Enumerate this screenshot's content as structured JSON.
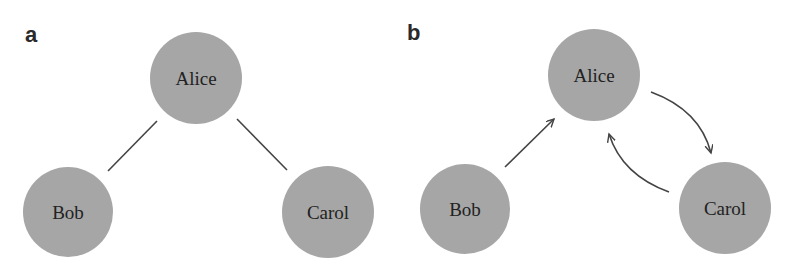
{
  "panels": [
    {
      "label": "a",
      "nodes": [
        {
          "id": "alice",
          "label": "Alice"
        },
        {
          "id": "bob",
          "label": "Bob"
        },
        {
          "id": "carol",
          "label": "Carol"
        }
      ],
      "edges": [
        {
          "from": "alice",
          "to": "bob",
          "directed": false
        },
        {
          "from": "alice",
          "to": "carol",
          "directed": false
        }
      ]
    },
    {
      "label": "b",
      "nodes": [
        {
          "id": "alice",
          "label": "Alice"
        },
        {
          "id": "bob",
          "label": "Bob"
        },
        {
          "id": "carol",
          "label": "Carol"
        }
      ],
      "edges": [
        {
          "from": "bob",
          "to": "alice",
          "directed": true
        },
        {
          "from": "alice",
          "to": "carol",
          "directed": true
        },
        {
          "from": "carol",
          "to": "alice",
          "directed": true
        }
      ]
    }
  ],
  "colors": {
    "node_fill": "#a6a6a6",
    "edge": "#444444",
    "text": "#222222"
  }
}
